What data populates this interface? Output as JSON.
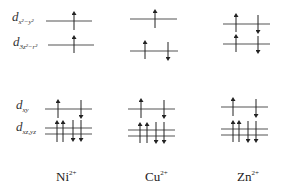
{
  "orbital_labels": {
    "dx2y2": {
      "main": "d",
      "sub": "x²−y²"
    },
    "dz2": {
      "main": "d",
      "sub": "3z²−r²"
    },
    "dxy": {
      "main": "d",
      "sub": "xy"
    },
    "dxzyz": {
      "main": "d",
      "sub": "xz,yz"
    }
  },
  "ions": [
    {
      "name": "Ni",
      "charge": "2+"
    },
    {
      "name": "Cu",
      "charge": "2+"
    },
    {
      "name": "Zn",
      "charge": "2+"
    }
  ],
  "levels": {
    "Ni": {
      "dx2y2": [
        "up"
      ],
      "dz2": [
        "up"
      ],
      "dxy": [
        "up",
        "down"
      ],
      "dxzyz": [
        "up",
        "up",
        "down",
        "down"
      ]
    },
    "Cu": {
      "dx2y2": [
        "up"
      ],
      "dz2": [
        "up",
        "down"
      ],
      "dxy": [
        "up",
        "down"
      ],
      "dxzyz": [
        "up",
        "up",
        "down",
        "down"
      ]
    },
    "Zn": {
      "dx2y2": [
        "up",
        "down"
      ],
      "dz2": [
        "up",
        "down"
      ],
      "dxy": [
        "up",
        "down"
      ],
      "dxzyz": [
        "up",
        "up",
        "down",
        "down"
      ]
    }
  },
  "colors": {
    "line": "#555555",
    "arrow": "#222222"
  }
}
